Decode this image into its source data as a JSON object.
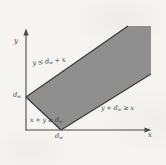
{
  "figure": {
    "axes": {
      "y_label": "y",
      "x_label": "x"
    },
    "ticks": {
      "y": {
        "pre": "d",
        "sub": "w",
        "post": ""
      },
      "x": {
        "pre": "d",
        "sub": "w",
        "post": ""
      }
    },
    "annotations": {
      "upper": {
        "pre": "y ≤ d",
        "sub": "w",
        "post": " + x"
      },
      "lower": {
        "pre": "y + d",
        "sub": "w",
        "post": " ≥ x"
      },
      "origin": {
        "pre": "x + y ≥ d",
        "sub": "w",
        "post": ""
      }
    },
    "region_constraints": [
      "y ≤ d_w + x",
      "y + d_w ≥ x",
      "x + y ≥ d_w"
    ],
    "colors": {
      "band_fill": "#8f8f8f",
      "band_edge": "#3c3c3c",
      "axis": "#4a4a4a",
      "text": "#3f3f3f",
      "paper": "#f5f4f1"
    }
  }
}
